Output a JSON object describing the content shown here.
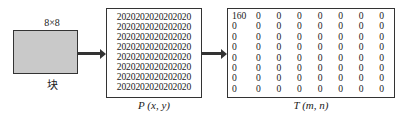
{
  "block": {
    "size_label": "8×8",
    "label": "块",
    "fill": "#c9c9c9"
  },
  "p_matrix": {
    "label": "P (x, y)",
    "rows": [
      "2020202020202020",
      "2020202020202020",
      "2020202020202020",
      "2020202020202020",
      "2020202020202020",
      "2020202020202020",
      "2020202020202020",
      "2020202020202020"
    ]
  },
  "t_matrix": {
    "label": "T (m, n)",
    "rows": [
      [
        "160",
        "0",
        "0",
        "0",
        "0",
        "0",
        "0",
        "0"
      ],
      [
        "0",
        "0",
        "0",
        "0",
        "0",
        "0",
        "0",
        "0"
      ],
      [
        "0",
        "0",
        "0",
        "0",
        "0",
        "0",
        "0",
        "0"
      ],
      [
        "0",
        "0",
        "0",
        "0",
        "0",
        "0",
        "0",
        "0"
      ],
      [
        "0",
        "0",
        "0",
        "0",
        "0",
        "0",
        "0",
        "0"
      ],
      [
        "0",
        "0",
        "0",
        "0",
        "0",
        "0",
        "0",
        "0"
      ],
      [
        "0",
        "0",
        "0",
        "0",
        "0",
        "0",
        "0",
        "0"
      ],
      [
        "0",
        "0",
        "0",
        "0",
        "0",
        "0",
        "0",
        "0"
      ]
    ]
  }
}
